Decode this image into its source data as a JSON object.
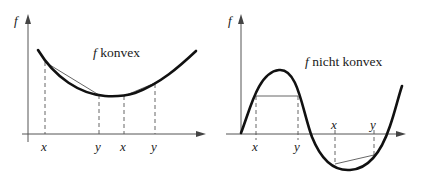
{
  "figure": {
    "panels": [
      {
        "id": "left",
        "y_axis_label": "f",
        "caption_f": "f",
        "caption_rest": " konvex",
        "tick_labels": [
          "x",
          "y",
          "x",
          "y"
        ]
      },
      {
        "id": "right",
        "y_axis_label": "f",
        "caption_f": "f",
        "caption_rest": " nicht konvex",
        "tick_labels": [
          "x",
          "y",
          "x",
          "y"
        ]
      }
    ]
  },
  "colors": {
    "curve": "#111111",
    "axis": "#555555",
    "chord": "#555555",
    "background": "#ffffff"
  }
}
